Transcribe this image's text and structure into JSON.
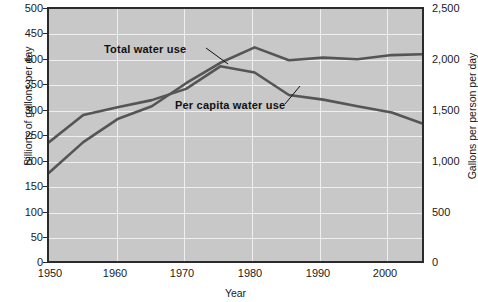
{
  "chart_data": {
    "type": "line",
    "title": "",
    "xlabel": "Year",
    "ylabel": "Billions of gallons per day",
    "ylabel_right": "Gallons per person per day",
    "xlim": [
      1950,
      2005
    ],
    "ylim": [
      0,
      500
    ],
    "ylim_right": [
      0,
      2500
    ],
    "grid": true,
    "legend_position": "inline-annotations",
    "x_ticks": [
      1950,
      1960,
      1970,
      1980,
      1990,
      2000
    ],
    "x_tick_labels": [
      "1950",
      "1960",
      "1970",
      "1980",
      "1990",
      "2000"
    ],
    "y_ticks_left": [
      0,
      50,
      100,
      150,
      200,
      250,
      300,
      350,
      400,
      450,
      500
    ],
    "y_tick_labels_left": [
      "0",
      "50",
      "100",
      "150",
      "200",
      "250",
      "300",
      "350",
      "400",
      "450",
      "500"
    ],
    "y_ticks_right": [
      0,
      500,
      1000,
      1500,
      2000,
      2500
    ],
    "y_tick_labels_right": [
      "0",
      "500",
      "1,000",
      "1,500",
      "2,000",
      "2,500"
    ],
    "x": [
      1950,
      1955,
      1960,
      1965,
      1970,
      1975,
      1980,
      1985,
      1990,
      1995,
      2000,
      2005
    ],
    "series": [
      {
        "name": "Total water use",
        "axis": "left",
        "units": "Billions of gallons per day",
        "color": "#555555",
        "values": [
          180,
          240,
          285,
          310,
          355,
          395,
          425,
          400,
          405,
          402,
          410,
          412
        ]
      },
      {
        "name": "Per capita water use",
        "axis": "right",
        "units": "Gallons per person per day",
        "color": "#555555",
        "values": [
          1200,
          1465,
          1540,
          1610,
          1720,
          1940,
          1880,
          1660,
          1615,
          1550,
          1490,
          1370
        ]
      }
    ],
    "annotations": [
      {
        "text": "Total water use",
        "points_to_year": 1975
      },
      {
        "text": "Per capita water use",
        "points_to_year": 1983
      }
    ]
  },
  "colors": {
    "plot_background": "#c8c8c8",
    "page_background": "#ffffff",
    "gridline": "#efefef",
    "axis": "#2b2b2b",
    "line": "#555555",
    "text": "#1a1a1a"
  }
}
